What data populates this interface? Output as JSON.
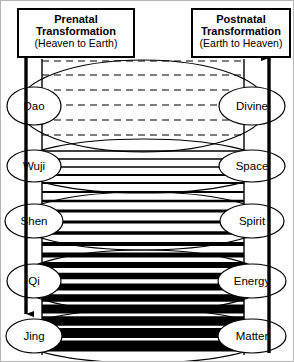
{
  "headers": {
    "left": {
      "title_line1": "Prenatal",
      "title_line2": "Transformation",
      "subtitle": "(Heaven to Earth)"
    },
    "right": {
      "title_line1": "Postnatal",
      "title_line2": "Transformation",
      "subtitle": "(Earth to Heaven)"
    }
  },
  "arrows": {
    "left": {
      "name": "downward-arrow",
      "direction": "down",
      "meaning": "Heaven to Earth"
    },
    "right": {
      "name": "upward-arrow",
      "direction": "up",
      "meaning": "Earth to Heaven"
    }
  },
  "levels": [
    {
      "left_label": "Dao",
      "right_label": "Divine",
      "density": "dashed",
      "line_weight": 1,
      "y": 105
    },
    {
      "left_label": "Wuji",
      "right_label": "Space",
      "density": "thin-solid",
      "line_weight": 1.6,
      "y": 165
    },
    {
      "left_label": "Shen",
      "right_label": "Spirit",
      "density": "medium-solid",
      "line_weight": 3,
      "y": 220
    },
    {
      "left_label": "Qi",
      "right_label": "Energy",
      "density": "thick-solid",
      "line_weight": 6,
      "y": 280
    },
    {
      "left_label": "Jing",
      "right_label": "Matter",
      "density": "very-thick-solid",
      "line_weight": 10,
      "y": 335
    }
  ],
  "colors": {
    "ink": "#000000",
    "background": "#ffffff",
    "border": "#b5b5b5"
  }
}
